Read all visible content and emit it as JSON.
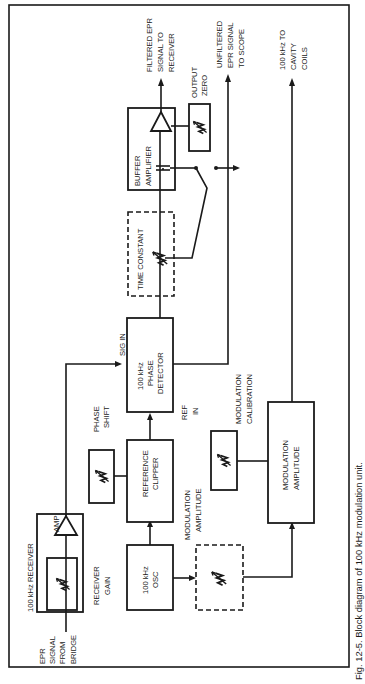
{
  "caption": "Fig. 12-5. Block diagram of 100 kHz modulation unit.",
  "blocks": {
    "receiver": {
      "title": "100 kHz  RECEIVER",
      "amp": "AMP"
    },
    "receiver_gain": [
      "RECEIVER",
      "GAIN"
    ],
    "input": [
      "EPR",
      "SIGNAL",
      "FROM",
      "BRIDGE"
    ],
    "osc": [
      "100 kHz",
      "OSC"
    ],
    "ref_clipper": [
      "REFERENCE",
      "CLIPPER"
    ],
    "phase_shift": [
      "PHASE",
      "SHIFT"
    ],
    "phase_detector": [
      "100 kHz",
      "PHASE",
      "DETECTOR"
    ],
    "sig_in": "SIG IN",
    "ref_in": [
      "REF",
      "IN"
    ],
    "mod_amp_label": [
      "MODULATION",
      "AMPLITUDE"
    ],
    "mod_amplitude": [
      "MODULATION",
      "AMPLITUDE"
    ],
    "mod_calibration": [
      "MODULATION",
      "CALIBRATION"
    ],
    "time_constant": "TIME CONSTANT",
    "buffer_amplifier": [
      "BUFFER",
      "AMPLIFIER"
    ],
    "output_zero": [
      "OUTPUT",
      "ZERO"
    ]
  },
  "outputs": {
    "filtered": [
      "FILTERED EPR",
      "SIGNAL TO",
      "RECEIVER"
    ],
    "unfiltered": [
      "UNFILTERED",
      "EPR SIGNAL",
      "TO SCOPE"
    ],
    "cavity": [
      "100 kHz TO",
      "CAVITY",
      "COILS"
    ]
  }
}
